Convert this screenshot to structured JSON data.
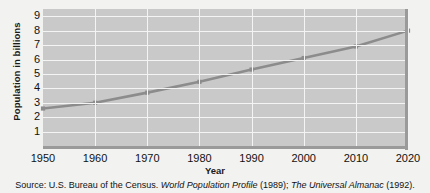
{
  "figure": {
    "ylabel": "Population in billions",
    "xlabel": "Year",
    "source_prefix": "Source: U.S. Bureau of the Census.",
    "source_title1": "World Population  Profile",
    "source_year1": "(1989);",
    "source_title2": "The Universal Almanac",
    "source_year2": "(1992)."
  },
  "colors": {
    "plot_background": "#c9c9c9",
    "gridline": "#f4f4f4",
    "series_line": "#8c8c8c",
    "frame": "#9a9a9a",
    "text": "#111111",
    "page_background": "#f2f2f0"
  },
  "chart_data": {
    "type": "line",
    "title": "",
    "xlabel": "Year",
    "ylabel": "Population in billions",
    "x": [
      1950,
      1960,
      1970,
      1980,
      1990,
      2000,
      2010,
      2020
    ],
    "values": [
      2.6,
      3.0,
      3.7,
      4.45,
      5.3,
      6.1,
      6.9,
      8.0
    ],
    "series": [
      {
        "name": "World population",
        "values": [
          2.6,
          3.0,
          3.7,
          4.45,
          5.3,
          6.1,
          6.9,
          8.0
        ]
      }
    ],
    "xlim": [
      1950,
      2020
    ],
    "ylim": [
      0,
      9.5
    ],
    "xticks": [
      "1950",
      "1960",
      "1970",
      "1980",
      "1990",
      "2000",
      "2010",
      "2020"
    ],
    "yticks": [
      "1",
      "2",
      "3",
      "4",
      "5",
      "6",
      "7",
      "8",
      "9"
    ],
    "grid": true,
    "legend": "none",
    "markers": "square"
  }
}
